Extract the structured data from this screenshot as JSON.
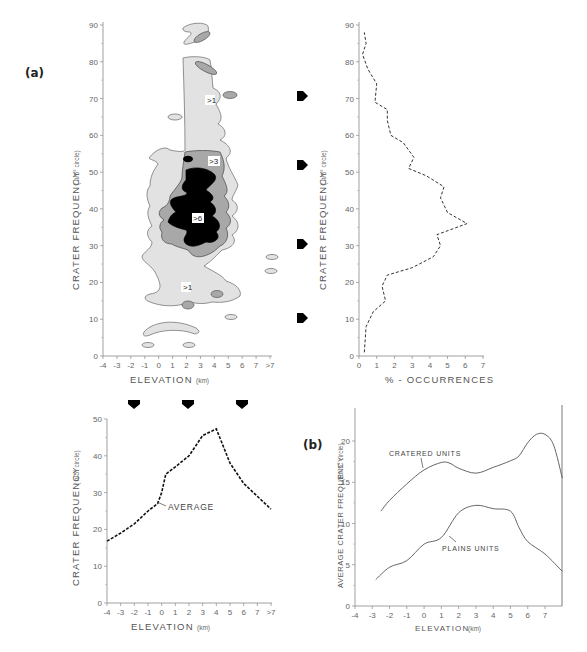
{
  "panels": {
    "a_label": "(a)",
    "b_label": "(b)"
  },
  "chart_data": [
    {
      "id": "contour",
      "type": "heatmap",
      "title": "",
      "xlabel": "ELEVATION",
      "xlabel_unit": "(km)",
      "ylabel": "CRATER  FREQUENCY",
      "ylabel_unit": "( n/5° circle)",
      "x_ticks": [
        "-4",
        "-3",
        "-2",
        "-1",
        "0",
        "1",
        "2",
        "3",
        "4",
        "5",
        "6",
        "7",
        ">7"
      ],
      "y_ticks": [
        "0",
        "10",
        "20",
        "30",
        "40",
        "50",
        "60",
        "70",
        "80",
        "90"
      ],
      "xlim": [
        -4,
        8
      ],
      "ylim": [
        0,
        90
      ],
      "contour_levels": [
        ">1",
        ">3",
        ">6"
      ],
      "contour_colors": {
        ">1": "#e0e0e0",
        ">3": "#a8a8a8",
        ">6": "#000000"
      },
      "arrow_markers_y": [
        70,
        52,
        30,
        10
      ]
    },
    {
      "id": "occurrence",
      "type": "line",
      "title": "",
      "xlabel": "% - OCCURRENCES",
      "ylabel": "CRATER  FREQUENCY",
      "ylabel_unit": "( n/5° circle)",
      "x_ticks": [
        "0",
        "1",
        "2",
        "3",
        "4",
        "5",
        "6",
        "7"
      ],
      "y_ticks": [
        "0",
        "10",
        "20",
        "30",
        "40",
        "50",
        "60",
        "70",
        "80",
        "90"
      ],
      "xlim": [
        0,
        7
      ],
      "ylim": [
        0,
        90
      ],
      "series": [
        {
          "name": "occurrence",
          "style": "dashed",
          "points": [
            [
              0.3,
              1
            ],
            [
              0.4,
              8
            ],
            [
              0.8,
              12
            ],
            [
              1.5,
              15
            ],
            [
              1.3,
              19
            ],
            [
              1.6,
              22
            ],
            [
              3,
              24
            ],
            [
              4.2,
              27
            ],
            [
              4.6,
              30
            ],
            [
              4.4,
              33
            ],
            [
              6.1,
              36
            ],
            [
              5,
              39
            ],
            [
              4.6,
              43
            ],
            [
              4.8,
              46
            ],
            [
              3.8,
              49
            ],
            [
              2.8,
              51
            ],
            [
              3.1,
              54
            ],
            [
              2.5,
              58
            ],
            [
              1.8,
              60
            ],
            [
              1.6,
              64
            ],
            [
              1.6,
              67
            ],
            [
              0.9,
              69
            ],
            [
              1,
              74
            ],
            [
              0.5,
              78
            ],
            [
              0.2,
              82
            ],
            [
              0.4,
              85
            ],
            [
              0.3,
              88
            ]
          ]
        }
      ]
    },
    {
      "id": "average",
      "type": "line",
      "title": "",
      "xlabel": "ELEVATION",
      "xlabel_unit": "(km)",
      "ylabel": "CRATER  FREQUENCY",
      "ylabel_unit": "( n/5° circle)",
      "x_ticks": [
        "-4",
        "-3",
        "-2",
        "-1",
        "0",
        "1",
        "2",
        "3",
        "4",
        "5",
        "6",
        "7",
        ">7"
      ],
      "y_ticks": [
        "0",
        "10",
        "20",
        "30",
        "40",
        "50"
      ],
      "xlim": [
        -4,
        8
      ],
      "ylim": [
        0,
        50
      ],
      "annotation": "AVERAGE",
      "arrow_markers_x": [
        -2,
        2,
        6
      ],
      "series": [
        {
          "name": "AVERAGE",
          "style": "dashed",
          "x": [
            -4,
            -3,
            -2,
            -1,
            -0.3,
            0,
            0.3,
            1,
            2,
            3,
            4,
            5,
            6,
            7,
            8
          ],
          "y": [
            16.8,
            19,
            21.5,
            25,
            27,
            30,
            35,
            37,
            40,
            45.5,
            47.3,
            38,
            32.5,
            29,
            25.5
          ]
        }
      ]
    },
    {
      "id": "units",
      "type": "line",
      "title": "",
      "xlabel": "ELEVATION",
      "xlabel_unit": "(km)",
      "ylabel": "AVERAGE CRATER FREQUENCY",
      "ylabel_unit": "(R / 5° circle)",
      "x_ticks": [
        "-4",
        "-3",
        "-2",
        "-1",
        "0",
        "1",
        "2",
        "3",
        "4",
        "5",
        "6",
        "7"
      ],
      "y_ticks": [
        "0",
        "5",
        "10",
        "15",
        "20"
      ],
      "xlim": [
        -4,
        8
      ],
      "ylim": [
        0,
        24
      ],
      "series": [
        {
          "name": "CRATERED UNITS",
          "x": [
            -2.5,
            -2,
            -1,
            0,
            1,
            1.5,
            2,
            3,
            4,
            5,
            5.5,
            6,
            6.5,
            7,
            7.5,
            8
          ],
          "y": [
            11.5,
            12.8,
            14.8,
            16.5,
            17.4,
            17.3,
            16.7,
            16.1,
            16.8,
            17.6,
            18.2,
            19.8,
            20.8,
            20.8,
            19.5,
            15.5
          ]
        },
        {
          "name": "PLAINS UNITS",
          "x": [
            -2.8,
            -2,
            -1,
            0,
            1,
            2,
            3,
            4,
            5,
            5.5,
            6,
            7,
            8
          ],
          "y": [
            3.2,
            4.7,
            5.5,
            7.5,
            8.3,
            11.3,
            12.2,
            11.8,
            11.5,
            9.5,
            7.8,
            6.3,
            4.2
          ]
        }
      ]
    }
  ]
}
